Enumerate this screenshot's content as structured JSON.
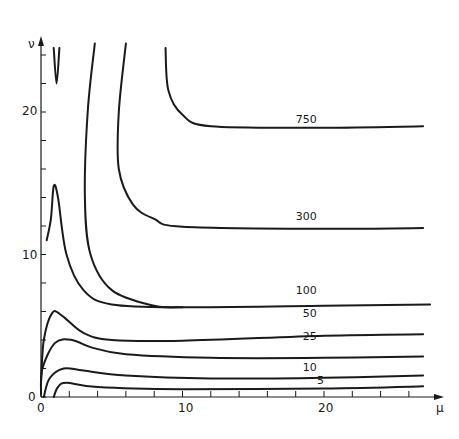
{
  "chart_data": {
    "type": "line",
    "subtype": "contour",
    "title": "",
    "xlabel": "μ",
    "ylabel": "ν",
    "xlim": [
      0,
      28
    ],
    "ylim": [
      0,
      25
    ],
    "x_ticks": [
      0,
      10,
      20
    ],
    "y_ticks": [
      0,
      10,
      20
    ],
    "x_minor_step": 2,
    "y_minor_step": 2,
    "grid": false,
    "legend": null,
    "series": [
      {
        "name": "5",
        "label_pos": [
          19.5,
          0.9
        ],
        "points": [
          [
            0.9,
            0
          ],
          [
            1.2,
            0.7
          ],
          [
            1.8,
            1.0
          ],
          [
            4,
            0.7
          ],
          [
            10,
            0.55
          ],
          [
            20,
            0.6
          ],
          [
            27,
            0.75
          ]
        ]
      },
      {
        "name": "10",
        "label_pos": [
          18.5,
          1.8
        ],
        "points": [
          [
            0.2,
            0
          ],
          [
            0.6,
            1.3
          ],
          [
            1.6,
            2.0
          ],
          [
            3,
            1.85
          ],
          [
            6,
            1.5
          ],
          [
            12,
            1.3
          ],
          [
            20,
            1.35
          ],
          [
            27,
            1.5
          ]
        ]
      },
      {
        "name": "25",
        "label_pos": [
          18.5,
          4.0
        ],
        "points": [
          [
            0.0,
            0.2
          ],
          [
            0.1,
            2.0
          ],
          [
            1.0,
            3.8
          ],
          [
            2.2,
            4.0
          ],
          [
            3.5,
            3.5
          ],
          [
            6,
            3.0
          ],
          [
            12,
            2.75
          ],
          [
            20,
            2.75
          ],
          [
            27,
            2.85
          ]
        ]
      },
      {
        "name": "50",
        "label_pos": [
          18.5,
          5.6
        ],
        "points": [
          [
            0.0,
            1.0
          ],
          [
            0.2,
            4.0
          ],
          [
            0.8,
            5.9
          ],
          [
            1.5,
            5.7
          ],
          [
            3,
            4.5
          ],
          [
            5,
            4.0
          ],
          [
            10,
            3.95
          ],
          [
            20,
            4.3
          ],
          [
            27,
            4.4
          ]
        ]
      },
      {
        "name": "100",
        "label_pos": [
          18.0,
          7.2
        ],
        "points": [
          [
            0.4,
            11.0
          ],
          [
            0.7,
            12.5
          ],
          [
            0.9,
            14.8
          ],
          [
            1.2,
            14.0
          ],
          [
            1.8,
            10.0
          ],
          [
            3,
            7.5
          ],
          [
            5,
            6.5
          ],
          [
            10,
            6.3
          ],
          [
            20,
            6.4
          ],
          [
            27.5,
            6.5
          ]
        ]
      },
      {
        "name": "300",
        "label_pos": [
          18.0,
          12.4
        ],
        "points": [
          [
            3.8,
            24.8
          ],
          [
            3.3,
            20.0
          ],
          [
            3.1,
            14.0
          ],
          [
            3.5,
            10.0
          ],
          [
            5,
            7.5
          ],
          [
            8,
            6.4
          ],
          [
            10,
            6.3
          ]
        ],
        "note": "high-ν branch joining 300 plateau shown separately"
      },
      {
        "name": "300-plateau",
        "label_pos": null,
        "points": [
          [
            6.0,
            24.8
          ],
          [
            5.5,
            20.0
          ],
          [
            5.5,
            16.0
          ],
          [
            6.5,
            13.5
          ],
          [
            8,
            12.5
          ],
          [
            10,
            11.95
          ],
          [
            20,
            11.8
          ],
          [
            27,
            11.85
          ]
        ]
      },
      {
        "name": "750",
        "label_pos": [
          18.0,
          19.2
        ],
        "points": [
          [
            8.8,
            24.5
          ],
          [
            9.0,
            21.5
          ],
          [
            10,
            19.8
          ],
          [
            12,
            19.0
          ],
          [
            20,
            18.9
          ],
          [
            27,
            19.0
          ]
        ]
      },
      {
        "name": "v-fragment",
        "label_pos": null,
        "points": [
          [
            0.9,
            24.5
          ],
          [
            1.1,
            22.0
          ],
          [
            1.3,
            24.5
          ]
        ]
      }
    ],
    "contour_labels": [
      "750",
      "300",
      "100",
      "50",
      "25",
      "10",
      "5"
    ]
  },
  "axes": {
    "x_label": "μ",
    "y_label": "ν",
    "x_tick_labels": [
      "0",
      "10",
      "20"
    ],
    "y_tick_labels": [
      "0",
      "10",
      "20"
    ]
  }
}
